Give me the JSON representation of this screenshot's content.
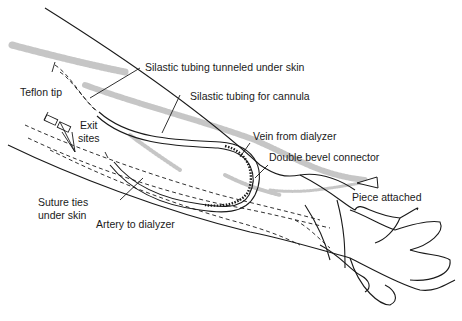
{
  "diagram": {
    "labels": {
      "silastic_tunneled": "Silastic tubing tunneled under skin",
      "silastic_cannula": "Silastic tubing for cannula",
      "teflon_tip": "Teflon tip",
      "exit_sites": "Exit\nsites",
      "vein_from_dialyzer": "Vein from dialyzer",
      "double_bevel": "Double bevel connector",
      "piece_attached": "Piece attached",
      "suture_ties": "Suture ties\nunder skin",
      "artery_to_dialyzer": "Artery to dialyzer"
    },
    "colors": {
      "line": "#1a1a1a",
      "stipple": "#b8b8b8"
    }
  }
}
